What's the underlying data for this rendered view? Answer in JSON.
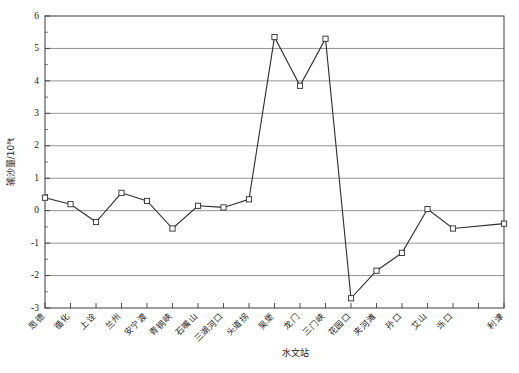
{
  "chart_data": {
    "type": "line",
    "title": "",
    "xlabel": "水文站",
    "ylabel": "输沙量/10⁸t",
    "ylim": [
      -3,
      6
    ],
    "ytick_values": [
      -3,
      -2,
      -1,
      0,
      1,
      2,
      3,
      4,
      5,
      6
    ],
    "ytick_labels": [
      "-3",
      "-2",
      "-1",
      "0",
      "1",
      "2",
      "3",
      "4",
      "5",
      "6"
    ],
    "grid": true,
    "legend": "none",
    "marker": "square-open",
    "categories": [
      "思德",
      "循化",
      "上诠",
      "兰州",
      "安宁渡",
      "青铜峡",
      "石嘴山",
      "三湖河口",
      "头道拐",
      "吴堡",
      "龙门",
      "三门峡",
      "花园口",
      "夹河滩",
      "孙口",
      "艾山",
      "泺口",
      "利津"
    ],
    "values": [
      0.4,
      0.2,
      -0.35,
      0.55,
      0.3,
      -0.55,
      0.15,
      0.1,
      0.35,
      5.35,
      3.85,
      5.3,
      -2.7,
      -1.85,
      -1.3,
      0.05,
      -0.55,
      -0.4
    ],
    "xtick_count": 19,
    "series": [
      {
        "name": "输沙量",
        "values": [
          0.4,
          0.2,
          -0.35,
          0.55,
          0.3,
          -0.55,
          0.15,
          0.1,
          0.35,
          5.35,
          3.85,
          5.3,
          -2.7,
          -1.85,
          -1.3,
          0.05,
          -0.55,
          -0.4
        ]
      }
    ]
  },
  "axis": {
    "y_title": "输沙量/10⁸t",
    "x_title": "水文站"
  }
}
